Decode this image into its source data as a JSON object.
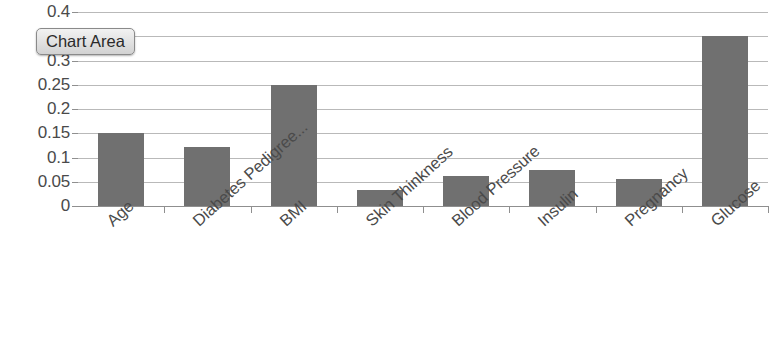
{
  "tooltip": {
    "label": "Chart Area"
  },
  "colors": {
    "bar_fill": "#707070",
    "gridline": "#b9b9b9",
    "axis": "#8f8f8f",
    "text": "#4a4a4a",
    "tooltip_bg": "#e4e4e4",
    "plot_bg": "#ffffff"
  },
  "chart_data": {
    "type": "bar",
    "title": "",
    "subtitle": "",
    "xlabel": "",
    "ylabel": "",
    "categories": [
      "Age",
      "Diabetes Pedigree...",
      "BMI",
      "Skin Thinkness",
      "Blood Pressure",
      "Insulin",
      "Pregnancy",
      "Glucose"
    ],
    "values": [
      0.15,
      0.122,
      0.25,
      0.032,
      0.061,
      0.075,
      0.055,
      0.35
    ],
    "ylim": [
      0,
      0.4
    ],
    "yticks": [
      0,
      0.05,
      0.1,
      0.15,
      0.2,
      0.25,
      0.3,
      0.35,
      0.4
    ],
    "ytick_labels": [
      "0",
      "0.05",
      "0.1",
      "0.15",
      "0.2",
      "0.25",
      "0.3",
      "0.35",
      "0.4"
    ],
    "grid": true,
    "legend": false,
    "legend_position": "none",
    "series": [
      {
        "name": "Feature Importance",
        "values": [
          0.15,
          0.122,
          0.25,
          0.032,
          0.061,
          0.075,
          0.055,
          0.35
        ]
      }
    ],
    "annotations": [
      "Chart Area"
    ]
  }
}
